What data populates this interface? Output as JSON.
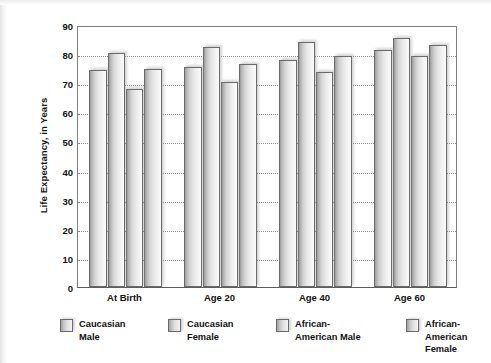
{
  "chart_data": {
    "type": "bar",
    "title": "",
    "xlabel": "",
    "ylabel": "Life Expectancy, in Years",
    "ylim": [
      0,
      90
    ],
    "ytick_step": 10,
    "yticks": [
      90,
      80,
      70,
      60,
      50,
      40,
      30,
      20,
      10,
      0
    ],
    "grid": true,
    "grid_axis": "y",
    "legend_position": "bottom",
    "categories": [
      "At Birth",
      "Age 20",
      "Age 40",
      "Age 60"
    ],
    "series": [
      {
        "name": "Caucasian\nMale",
        "legend_label": "Caucasian\nMale",
        "values": [
          74.5,
          75.5,
          78.0,
          81.5
        ]
      },
      {
        "name": "Caucasian\nFemale",
        "legend_label": "Caucasian\nFemale",
        "values": [
          80.5,
          82.5,
          84.0,
          85.5
        ]
      },
      {
        "name": "African-\nAmerican Male",
        "legend_label": "African-\nAmerican Male",
        "values": [
          68.0,
          70.5,
          74.0,
          79.5
        ]
      },
      {
        "name": "African-\nAmerican Female",
        "legend_label": "African-\nAmerican Female",
        "values": [
          75.0,
          76.5,
          79.5,
          83.0
        ]
      }
    ]
  },
  "style": {
    "bar_border_color": "#6a6a6a",
    "axis_color": "#7d7d7d",
    "gridline_color": "#8d8d8d",
    "text_color": "#111111",
    "background": "#ffffff"
  }
}
